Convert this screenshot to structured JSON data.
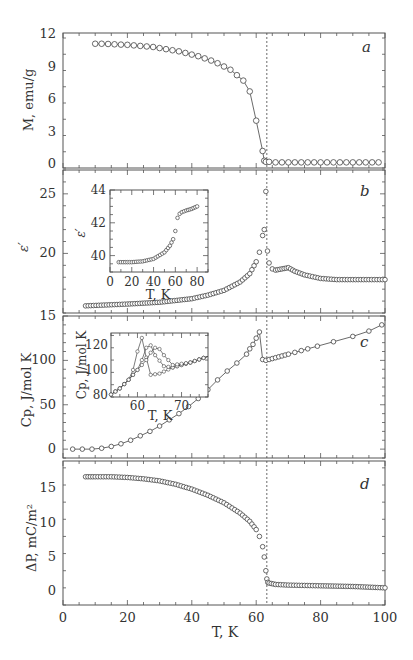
{
  "chart_data": [
    {
      "panel": "a",
      "type": "line",
      "ylabel": "M, emu/g",
      "xlabel": "",
      "ylim": [
        0,
        12
      ],
      "yticks": [
        0,
        3,
        6,
        9,
        12
      ],
      "xlim": [
        0,
        100
      ],
      "x": [
        10,
        12,
        14,
        16,
        18,
        20,
        22,
        24,
        26,
        28,
        30,
        32,
        34,
        36,
        38,
        40,
        42,
        44,
        46,
        48,
        50,
        52,
        54,
        56,
        58,
        60,
        62,
        62.5,
        63,
        64,
        66,
        68,
        70,
        72,
        74,
        76,
        78,
        80,
        82,
        84,
        86,
        88,
        90,
        92,
        94,
        96,
        98
      ],
      "values": [
        11.1,
        11.1,
        11.08,
        11.05,
        11.02,
        11.0,
        10.95,
        10.9,
        10.85,
        10.8,
        10.7,
        10.6,
        10.5,
        10.4,
        10.25,
        10.1,
        9.95,
        9.75,
        9.55,
        9.3,
        9.0,
        8.7,
        8.2,
        7.7,
        6.7,
        4.0,
        1.2,
        0.3,
        0.2,
        0.2,
        0.15,
        0.15,
        0.15,
        0.15,
        0.15,
        0.15,
        0.15,
        0.15,
        0.15,
        0.15,
        0.15,
        0.15,
        0.15,
        0.15,
        0.15,
        0.15,
        0.15
      ]
    },
    {
      "panel": "b",
      "type": "scatter",
      "ylabel": "ε′",
      "ylim": [
        15,
        27
      ],
      "yticks": [
        20,
        25
      ],
      "xlim": [
        0,
        100
      ],
      "x": [
        7,
        20,
        30,
        40,
        45,
        50,
        55,
        58,
        60,
        61,
        62,
        62.5,
        63,
        63.5,
        64,
        65,
        66,
        68,
        70,
        72,
        75,
        80,
        85,
        90,
        95,
        100
      ],
      "values": [
        15.6,
        15.75,
        15.9,
        16.2,
        16.5,
        16.9,
        17.6,
        18.3,
        19.3,
        20.1,
        21.5,
        22.0,
        25.2,
        20.2,
        19.2,
        18.7,
        18.6,
        18.7,
        18.8,
        18.5,
        18.2,
        17.9,
        17.8,
        17.8,
        17.8,
        17.8
      ],
      "inset": {
        "type": "scatter",
        "ylabel": "ε′",
        "xlabel": "T, K",
        "xlim": [
          0,
          90
        ],
        "ylim": [
          39,
          44
        ],
        "xticks": [
          0,
          20,
          40,
          60,
          80
        ],
        "yticks": [
          40,
          42,
          44
        ],
        "x": [
          8,
          20,
          30,
          40,
          50,
          55,
          58,
          60,
          62,
          64,
          66,
          70,
          75,
          80
        ],
        "values": [
          39.6,
          39.6,
          39.65,
          39.8,
          40.2,
          40.6,
          41.0,
          41.5,
          42.3,
          42.55,
          42.65,
          42.75,
          42.85,
          43.0
        ]
      }
    },
    {
      "panel": "c",
      "type": "line",
      "ylabel": "Cp, J/mol K",
      "ylim": [
        -10,
        150
      ],
      "yticks": [
        0,
        50,
        100,
        150
      ],
      "xlim": [
        0,
        100
      ],
      "x": [
        3,
        6,
        9,
        12,
        15,
        18,
        21,
        24,
        27,
        30,
        33,
        36,
        39,
        42,
        45,
        48,
        51,
        54,
        57,
        58,
        59,
        60,
        61,
        62,
        63,
        64,
        65,
        66,
        67,
        68,
        69,
        70,
        72,
        74,
        76,
        79,
        84,
        90,
        95,
        99
      ],
      "values": [
        0,
        0,
        0,
        1,
        3,
        6,
        10,
        15,
        20,
        26,
        33,
        40,
        48,
        57,
        67,
        78,
        88,
        97,
        107,
        113,
        118,
        125,
        132,
        101,
        100,
        101,
        102,
        103,
        104,
        105,
        106,
        107,
        109,
        111,
        113,
        116,
        121,
        127,
        133,
        140
      ],
      "inset": {
        "type": "scatter",
        "ylabel": "Cp, J/mol K",
        "xlabel": "T, K",
        "xlim": [
          54,
          76
        ],
        "ylim": [
          78,
          130
        ],
        "xticks": [
          60,
          70
        ],
        "yticks": [
          80,
          100,
          120
        ],
        "series": [
          {
            "name": "curve 1",
            "x": [
              54,
              56,
              58,
              59,
              60,
              61,
              62,
              63,
              65,
              68,
              72,
              76
            ],
            "values": [
              80,
              85,
              92,
              100,
              115,
              126,
              110,
              96,
              97,
              102,
              106,
              111
            ]
          },
          {
            "name": "curve 2",
            "x": [
              54,
              56,
              58,
              60,
              61,
              62,
              63,
              64,
              66,
              68,
              72,
              76
            ],
            "values": [
              80,
              85,
              92,
              100,
              108,
              118,
              120,
              112,
              103,
              102,
              106,
              111
            ]
          },
          {
            "name": "curve 3",
            "x": [
              54,
              56,
              58,
              60,
              62,
              63,
              64,
              65,
              66,
              68,
              72,
              76
            ],
            "values": [
              80,
              85,
              92,
              100,
              108,
              114,
              118,
              117,
              112,
              104,
              106,
              111
            ]
          }
        ]
      }
    },
    {
      "panel": "d",
      "type": "scatter",
      "ylabel": "ΔP, mC/m²",
      "xlabel": "T, K",
      "ylim": [
        -2,
        19
      ],
      "yticks": [
        0,
        5,
        10,
        15
      ],
      "xlim": [
        0,
        100
      ],
      "xticks": [
        0,
        20,
        40,
        60,
        80,
        100
      ],
      "x": [
        7,
        10,
        15,
        20,
        25,
        30,
        35,
        40,
        45,
        50,
        55,
        58,
        60,
        61,
        62,
        62.5,
        63,
        63.3,
        63.6,
        64,
        66,
        70,
        75,
        80,
        90,
        100
      ],
      "values": [
        16.7,
        16.7,
        16.7,
        16.6,
        16.4,
        16.1,
        15.6,
        14.9,
        14.0,
        12.9,
        11.4,
        10.2,
        9.0,
        8.0,
        6.5,
        5.0,
        3.0,
        1.8,
        1.3,
        1.2,
        1.0,
        0.9,
        0.85,
        0.8,
        0.7,
        0.5
      ]
    }
  ],
  "panels": {
    "a": {
      "letter": "a",
      "ylabel": "M, emu/g",
      "yticks": [
        "0",
        "3",
        "6",
        "9",
        "12"
      ]
    },
    "b": {
      "letter": "b",
      "ylabel": "ε′",
      "yticks": [
        "20",
        "25"
      ],
      "inset_ylabel": "ε′",
      "inset_xlabel": "T, K",
      "inset_xticks": [
        "0",
        "20",
        "40",
        "60",
        "80"
      ],
      "inset_yticks": [
        "40",
        "42",
        "44"
      ]
    },
    "c": {
      "letter": "c",
      "ylabel": "Cp, J/mol K",
      "yticks": [
        "0",
        "50",
        "100",
        "15"
      ],
      "inset_ylabel": "Cp, J/mol K",
      "inset_xlabel": "T, K",
      "inset_xticks": [
        "60",
        "70"
      ],
      "inset_yticks": [
        "80",
        "100",
        "120"
      ]
    },
    "d": {
      "letter": "d",
      "ylabel": "ΔP, mC/m²",
      "yticks": [
        "0",
        "5",
        "10",
        "15"
      ]
    }
  },
  "xaxis": {
    "label": "T, K",
    "ticks": [
      "0",
      "20",
      "40",
      "60",
      "80",
      "100"
    ]
  },
  "transition_T": 63.3
}
